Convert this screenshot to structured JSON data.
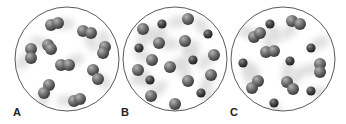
{
  "figure": {
    "panels": [
      {
        "label": "A",
        "description": "diatomic molecules of one element",
        "circle": {
          "cx": 67,
          "cy": 59,
          "r": 52
        },
        "label_pos": {
          "x": 13,
          "y": 106
        },
        "molecules": [
          {
            "atoms": [
              [
                51,
                25
              ],
              [
                58,
                23
              ]
            ],
            "type": "large"
          },
          {
            "atoms": [
              [
                83,
                31
              ],
              [
                91,
                33
              ]
            ],
            "type": "large"
          },
          {
            "atoms": [
              [
                31,
                49
              ],
              [
                31,
                58
              ]
            ],
            "type": "large"
          },
          {
            "atoms": [
              [
                48,
                45
              ],
              [
                51,
                49
              ]
            ],
            "type": "large"
          },
          {
            "atoms": [
              [
                105,
                47
              ],
              [
                103,
                53
              ]
            ],
            "type": "large"
          },
          {
            "atoms": [
              [
                61,
                65
              ],
              [
                69,
                65
              ]
            ],
            "type": "large"
          },
          {
            "atoms": [
              [
                93,
                70
              ],
              [
                98,
                79
              ]
            ],
            "type": "large"
          },
          {
            "atoms": [
              [
                49,
                85
              ],
              [
                44,
                93
              ]
            ],
            "type": "large"
          },
          {
            "atoms": [
              [
                74,
                101
              ],
              [
                80,
                99
              ]
            ],
            "type": "large"
          }
        ]
      },
      {
        "label": "B",
        "description": "mixture of atoms of two elements",
        "circle": {
          "cx": 175,
          "cy": 59,
          "r": 52
        },
        "label_pos": {
          "x": 121,
          "y": 106
        },
        "molecules": [
          {
            "atoms": [
              [
                143,
                29
              ]
            ],
            "type": "large"
          },
          {
            "atoms": [
              [
                162,
                24
              ]
            ],
            "type": "small"
          },
          {
            "atoms": [
              [
                188,
                19
              ]
            ],
            "type": "large"
          },
          {
            "atoms": [
              [
                208,
                34
              ]
            ],
            "type": "small"
          },
          {
            "atoms": [
              [
                139,
                48
              ]
            ],
            "type": "small"
          },
          {
            "atoms": [
              [
                159,
                43
              ]
            ],
            "type": "large"
          },
          {
            "atoms": [
              [
                185,
                41
              ]
            ],
            "type": "large"
          },
          {
            "atoms": [
              [
                214,
                55
              ]
            ],
            "type": "large"
          },
          {
            "atoms": [
              [
                152,
                60
              ]
            ],
            "type": "large"
          },
          {
            "atoms": [
              [
                193,
                60
              ]
            ],
            "type": "small"
          },
          {
            "atoms": [
              [
                170,
                67
              ]
            ],
            "type": "large"
          },
          {
            "atoms": [
              [
                138,
                70
              ]
            ],
            "type": "large"
          },
          {
            "atoms": [
              [
                211,
                75
              ]
            ],
            "type": "large"
          },
          {
            "atoms": [
              [
                150,
                80
              ]
            ],
            "type": "small"
          },
          {
            "atoms": [
              [
                188,
                81
              ]
            ],
            "type": "large"
          },
          {
            "atoms": [
              [
                151,
                96
              ]
            ],
            "type": "large"
          },
          {
            "atoms": [
              [
                201,
                93
              ]
            ],
            "type": "small"
          },
          {
            "atoms": [
              [
                175,
                104
              ]
            ],
            "type": "large"
          }
        ]
      },
      {
        "label": "C",
        "description": "mixture of diatomic molecules and atoms",
        "circle": {
          "cx": 283,
          "cy": 59,
          "r": 52
        },
        "label_pos": {
          "x": 230,
          "y": 106
        },
        "molecules": [
          {
            "atoms": [
              [
                270,
                24
              ]
            ],
            "type": "small"
          },
          {
            "atoms": [
              [
                292,
                21
              ],
              [
                300,
                24
              ]
            ],
            "type": "large"
          },
          {
            "atoms": [
              [
                254,
                37
              ],
              [
                260,
                33
              ]
            ],
            "type": "large"
          },
          {
            "atoms": [
              [
                266,
                52
              ],
              [
                274,
                51
              ]
            ],
            "type": "large"
          },
          {
            "atoms": [
              [
                311,
                48
              ]
            ],
            "type": "small"
          },
          {
            "atoms": [
              [
                243,
                63
              ]
            ],
            "type": "small"
          },
          {
            "atoms": [
              [
                290,
                61
              ]
            ],
            "type": "small"
          },
          {
            "atoms": [
              [
                320,
                64
              ],
              [
                320,
                72
              ]
            ],
            "type": "large"
          },
          {
            "atoms": [
              [
                258,
                81
              ],
              [
                252,
                88
              ]
            ],
            "type": "large"
          },
          {
            "atoms": [
              [
                287,
                82
              ],
              [
                293,
                89
              ]
            ],
            "type": "large"
          },
          {
            "atoms": [
              [
                311,
                91
              ]
            ],
            "type": "small"
          },
          {
            "atoms": [
              [
                274,
                103
              ]
            ],
            "type": "small"
          }
        ]
      }
    ],
    "colors": {
      "outline": "#5a5a5a",
      "large_atom_light": "#a8a8a8",
      "large_atom_dark": "#4a4a4a",
      "small_atom_light": "#8a8a8a",
      "small_atom_dark": "#2e2e2e",
      "blur": "#d6d6d6"
    }
  }
}
